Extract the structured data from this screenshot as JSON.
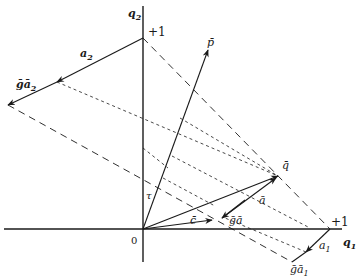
{
  "figure": {
    "type": "vector-geometry-diagram",
    "axes": {
      "horizontal_label": "q",
      "horizontal_sub": "1",
      "vertical_label": "q",
      "vertical_sub": "2",
      "origin_label": "0",
      "unit_q1_label": "+1",
      "unit_q2_label": "+1"
    },
    "vectors": [
      {
        "name": "p",
        "label": "p̄",
        "from": "origin",
        "to": "p-tip"
      },
      {
        "name": "q",
        "label": "q̄",
        "from": "origin",
        "to": "q-tip"
      },
      {
        "name": "a",
        "label": "ā",
        "from": "ga-point",
        "to": "q-tip"
      },
      {
        "name": "c",
        "label": "c̄",
        "from": "origin",
        "to": "c-tip"
      },
      {
        "name": "ga",
        "label": "ḡā",
        "from": "q-tip",
        "to": "ga-point"
      },
      {
        "name": "a1",
        "label": "a",
        "sub": "1",
        "from": "unit-q1",
        "to": "ga1-point"
      },
      {
        "name": "ga1",
        "label": "ḡā",
        "sub": "1"
      },
      {
        "name": "a2",
        "label": "a",
        "sub": "2",
        "from": "unit-q2",
        "to": "ga2-end"
      },
      {
        "name": "ga2",
        "label": "ḡā",
        "sub": "2"
      }
    ],
    "annotations": {
      "tau_label": "τ"
    },
    "colors": {
      "ink": "#1a1a1a",
      "background": "#ffffff"
    }
  }
}
